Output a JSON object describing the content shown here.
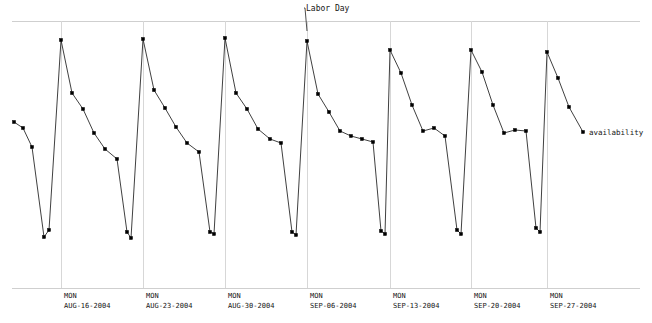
{
  "chart": {
    "series_label": "availability",
    "annotation_label": "Labor Day",
    "axis_color": "#cfcfcf",
    "grid_color": "#d7d7d7",
    "line_color": "#2a2a2a",
    "marker_color": "#000000",
    "background": "#ffffff"
  },
  "chart_data": {
    "type": "line",
    "title": "",
    "xlabel": "",
    "ylabel": "availability",
    "grid": true,
    "legend_position": "right-inline",
    "xlim": [
      0,
      652
    ],
    "ylim": [
      21,
      288
    ],
    "y_axis_inverted_pixels": true,
    "categories": [
      "MON AUG-16-2004",
      "MON AUG-23-2004",
      "MON AUG-30-2004",
      "MON SEP-06-2004",
      "MON SEP-13-2004",
      "MON SEP-20-2004",
      "MON SEP-27-2004"
    ],
    "gridline_x": [
      61,
      143,
      225,
      307,
      390,
      471,
      547
    ],
    "tick_labels": [
      {
        "dow": "MON",
        "date": "AUG-16-2004",
        "x": 61
      },
      {
        "dow": "MON",
        "date": "AUG-23-2004",
        "x": 143
      },
      {
        "dow": "MON",
        "date": "AUG-30-2004",
        "x": 225
      },
      {
        "dow": "MON",
        "date": "SEP-06-2004",
        "x": 307
      },
      {
        "dow": "MON",
        "date": "SEP-13-2004",
        "x": 390
      },
      {
        "dow": "MON",
        "date": "SEP-20-2004",
        "x": 471
      },
      {
        "dow": "MON",
        "date": "SEP-27-2004",
        "x": 547
      }
    ],
    "annotations": [
      {
        "text": "Labor Day",
        "target_x": 307,
        "target_y": 21,
        "label_x": 306,
        "label_y": 10
      }
    ],
    "series": [
      {
        "name": "availability",
        "marker": "filled-square",
        "points": [
          [
            14,
            122
          ],
          [
            23,
            128
          ],
          [
            32,
            147
          ],
          [
            44,
            237
          ],
          [
            49,
            230
          ],
          [
            61,
            40
          ],
          [
            72,
            93
          ],
          [
            83,
            109
          ],
          [
            94,
            133
          ],
          [
            105,
            149
          ],
          [
            117,
            159
          ],
          [
            127,
            232
          ],
          [
            131,
            238
          ],
          [
            143,
            39
          ],
          [
            154,
            90
          ],
          [
            165,
            108
          ],
          [
            176,
            127
          ],
          [
            187,
            143
          ],
          [
            199,
            152
          ],
          [
            210,
            232
          ],
          [
            214,
            234
          ],
          [
            225,
            38
          ],
          [
            236,
            93
          ],
          [
            247,
            109
          ],
          [
            258,
            129
          ],
          [
            270,
            139
          ],
          [
            281,
            143
          ],
          [
            292,
            232
          ],
          [
            296,
            235
          ],
          [
            307,
            41
          ],
          [
            318,
            94
          ],
          [
            329,
            112
          ],
          [
            340,
            131
          ],
          [
            351,
            136
          ],
          [
            362,
            139
          ],
          [
            373,
            142
          ],
          [
            381,
            231
          ],
          [
            385,
            234
          ],
          [
            390,
            50
          ],
          [
            401,
            73
          ],
          [
            412,
            105
          ],
          [
            423,
            131
          ],
          [
            434,
            128
          ],
          [
            445,
            136
          ],
          [
            457,
            230
          ],
          [
            461,
            234
          ],
          [
            471,
            50
          ],
          [
            482,
            72
          ],
          [
            493,
            105
          ],
          [
            504,
            133
          ],
          [
            515,
            130
          ],
          [
            526,
            131
          ],
          [
            536,
            228
          ],
          [
            540,
            232
          ],
          [
            547,
            52
          ],
          [
            558,
            78
          ],
          [
            569,
            107
          ],
          [
            583,
            132
          ]
        ]
      }
    ]
  }
}
